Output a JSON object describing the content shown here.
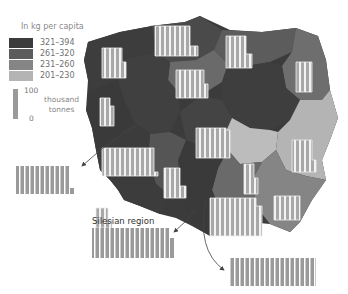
{
  "legend": {
    "title": "In kg per capita",
    "classes": [
      {
        "range": "321–394",
        "color": "#3b3b3b"
      },
      {
        "range": "261–320",
        "color": "#5c5c5c"
      },
      {
        "range": "231–260",
        "color": "#858585"
      },
      {
        "range": "201–230",
        "color": "#b4b4b4"
      }
    ]
  },
  "scale": {
    "max_label": "100",
    "min_label": "0",
    "unit_line1": "thousand",
    "unit_line2": "tonnes"
  },
  "callouts": {
    "silesian_label": "Silesian region"
  },
  "colors": {
    "bar_fill": "#a6a6a6",
    "bar_stroke": "#f2f2f2",
    "callout_bar": "#9c9c9c",
    "arrow": "#555555"
  }
}
